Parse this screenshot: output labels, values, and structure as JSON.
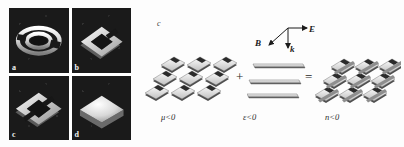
{
  "figure": {
    "micrograph_panels": [
      {
        "letter": "a",
        "name": "circular-split-ring-resonator"
      },
      {
        "letter": "b",
        "name": "square-split-ring-resonator"
      },
      {
        "letter": "c",
        "name": "double-square-split-ring-resonator"
      },
      {
        "letter": "d",
        "name": "solid-square-plate"
      }
    ],
    "schematic": {
      "letter": "c",
      "axes": [
        {
          "label": "E",
          "name": "electric-field-vector"
        },
        {
          "label": "B",
          "name": "magnetic-field-vector"
        },
        {
          "label": "k",
          "name": "wave-vector"
        }
      ],
      "operators": {
        "plus": "+",
        "equals": "="
      },
      "terms": [
        {
          "caption": "μ<0",
          "name": "negative-permeability-array"
        },
        {
          "caption": "ε<0",
          "name": "negative-permittivity-wires"
        },
        {
          "caption": "n<0",
          "name": "negative-index-composite"
        }
      ]
    },
    "colors": {
      "micrograph_background": "#1a1a1a",
      "metal_light": "#f0f0f0",
      "metal_mid": "#bdbdbd",
      "metal_dark": "#6f6f6f",
      "page_background": "#fdfdfd",
      "ink": "#1b1b1b"
    }
  }
}
